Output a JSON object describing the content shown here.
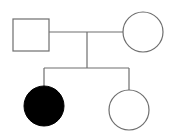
{
  "diagram": {
    "type": "pedigree",
    "colors": {
      "line": "#6e6e6e",
      "affected_fill": "#000000",
      "unaffected_fill": "#ffffff",
      "background": "#ffffff"
    },
    "individuals": [
      {
        "id": "father",
        "sex": "male",
        "shape": "square",
        "affected": false,
        "generation": 1
      },
      {
        "id": "mother",
        "sex": "female",
        "shape": "circle",
        "affected": false,
        "generation": 1
      },
      {
        "id": "daughter-1",
        "sex": "female",
        "shape": "circle",
        "affected": true,
        "generation": 2
      },
      {
        "id": "daughter-2",
        "sex": "female",
        "shape": "circle",
        "affected": false,
        "generation": 2
      }
    ],
    "relationships": [
      {
        "type": "mating",
        "between": [
          "father",
          "mother"
        ]
      },
      {
        "type": "offspring",
        "parents": [
          "father",
          "mother"
        ],
        "children": [
          "daughter-1",
          "daughter-2"
        ]
      }
    ]
  }
}
